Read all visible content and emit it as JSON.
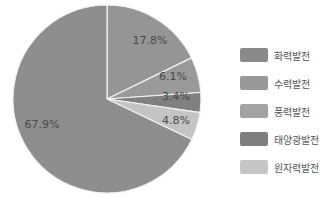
{
  "chart_data": {
    "type": "pie",
    "title": "",
    "start_angle": "12 o'clock, clockwise",
    "slices": [
      {
        "label": "수력발전",
        "value": 17.8,
        "display": "17.8%",
        "color": "#959595"
      },
      {
        "label": "풍력발전",
        "value": 6.1,
        "display": "6.1%",
        "color": "#9a9a9a"
      },
      {
        "label": "태양광발전",
        "value": 3.4,
        "display": "3.4%",
        "color": "#808080"
      },
      {
        "label": "원자력발전",
        "value": 4.8,
        "display": "4.8%",
        "color": "#c4c4c4"
      },
      {
        "label": "화력발전",
        "value": 67.9,
        "display": "67.9%",
        "color": "#8e8e8e"
      }
    ],
    "legend_position": "right"
  },
  "legend": [
    {
      "label": "화력발전",
      "color": "#8a8a8a"
    },
    {
      "label": "수력발전",
      "color": "#999999"
    },
    {
      "label": "풍력발전",
      "color": "#a3a3a3"
    },
    {
      "label": "태양광발전",
      "color": "#7f7f7f"
    },
    {
      "label": "원자력발전",
      "color": "#c6c6c6"
    }
  ]
}
